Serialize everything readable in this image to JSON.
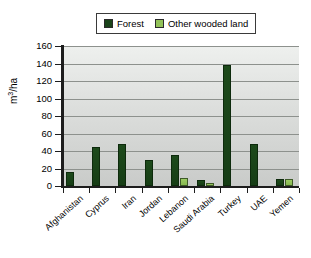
{
  "chart_data": {
    "type": "bar",
    "title": "",
    "subtitle": "",
    "xlabel": "",
    "ylabel": "m3/ha",
    "ylabel_display": "m³/ha",
    "ylim": [
      0,
      160
    ],
    "ytick_step": 20,
    "yticks": [
      160,
      140,
      120,
      100,
      80,
      60,
      40,
      20,
      0
    ],
    "grid": true,
    "grid_axis": "y",
    "legend_position": "top-center",
    "categories": [
      "Afghanistan",
      "Cyprus",
      "Iran",
      "Jordan",
      "Lebanon",
      "Saudi Arabia",
      "Turkey",
      "UAE",
      "Yemen"
    ],
    "series": [
      {
        "name": "Forest",
        "color": "#1a441a",
        "values": [
          16,
          45,
          48,
          30,
          36,
          7,
          138,
          48,
          8
        ]
      },
      {
        "name": "Other wooded land",
        "color": "#92c258",
        "values": [
          0,
          0,
          0,
          0,
          9,
          4,
          0,
          0,
          8
        ]
      }
    ],
    "annotations": []
  },
  "legend": {
    "entries": [
      {
        "label": "Forest",
        "color": "#1a441a"
      },
      {
        "label": "Other wooded land",
        "color": "#92c258"
      }
    ]
  },
  "axes": {
    "y_title": "m³/ha",
    "y_title_base": "m",
    "y_title_sup": "3",
    "y_title_tail": "/ha"
  },
  "colors": {
    "forest": "#1a441a",
    "other_wooded_land": "#92c258",
    "plot_background": "#dcdedc",
    "gridline": "#8d918d",
    "axis": "#1d1d1d",
    "page_background": "#ffffff",
    "text": "#000000"
  }
}
